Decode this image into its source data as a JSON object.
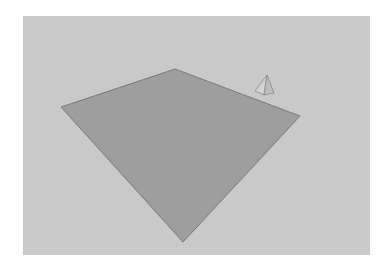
{
  "viewport": {
    "background": "#c9c9c9",
    "bounds": {
      "x": 23,
      "y": 16,
      "width": 347,
      "height": 239
    }
  },
  "scene": {
    "plane": {
      "label": "ground plane",
      "fill": "#9e9e9e",
      "stroke": "#7a7a7a",
      "points": [
        [
          175,
          69
        ],
        [
          300,
          116
        ],
        [
          183,
          242
        ],
        [
          61,
          107
        ]
      ]
    },
    "pyramid": {
      "label": "pyramid",
      "apex": [
        267,
        75
      ],
      "base_left": [
        255,
        91
      ],
      "base_front": [
        264,
        95
      ],
      "base_right": [
        274,
        93
      ],
      "face_left_fill": "#d2d2d2",
      "face_right_fill": "#bdbdbd",
      "stroke": "#8a8a8a"
    }
  }
}
